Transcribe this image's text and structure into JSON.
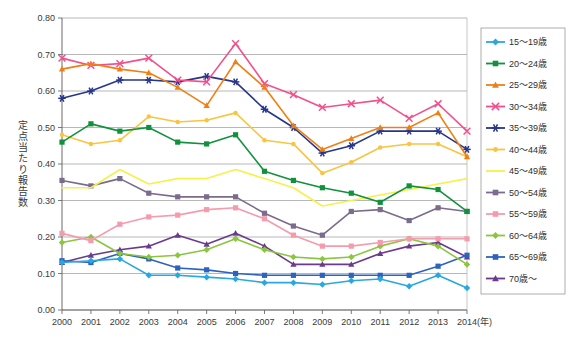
{
  "chart_data": {
    "type": "line",
    "title": "",
    "xlabel": "(年)",
    "ylabel": "定点当たり報告数",
    "x": [
      2000,
      2001,
      2002,
      2003,
      2004,
      2005,
      2006,
      2007,
      2008,
      2009,
      2010,
      2011,
      2012,
      2013,
      2014
    ],
    "xtick_labels": [
      "2000",
      "2001",
      "2002",
      "2003",
      "2004",
      "2005",
      "2006",
      "2007",
      "2008",
      "2009",
      "2010",
      "2011",
      "2012",
      "2013",
      "2014"
    ],
    "ytick_labels": [
      "0.00",
      "0.10",
      "0.20",
      "0.30",
      "0.40",
      "0.50",
      "0.60",
      "0.70",
      "0.80"
    ],
    "ylim": [
      0.0,
      0.8
    ],
    "ytick_step": 0.1,
    "grid": "horizontal",
    "legend_position": "right",
    "series": [
      {
        "name": "15～19歳",
        "color": "#29A8E0",
        "marker": "diamond",
        "values": [
          0.13,
          0.135,
          0.14,
          0.095,
          0.095,
          0.09,
          0.085,
          0.075,
          0.075,
          0.07,
          0.08,
          0.085,
          0.065,
          0.095,
          0.06
        ]
      },
      {
        "name": "20～24歳",
        "color": "#12913C",
        "marker": "square",
        "values": [
          0.46,
          0.51,
          0.49,
          0.5,
          0.46,
          0.455,
          0.48,
          0.38,
          0.355,
          0.335,
          0.32,
          0.295,
          0.34,
          0.33,
          0.27
        ]
      },
      {
        "name": "25～29歳",
        "color": "#F07F13",
        "marker": "triangle",
        "values": [
          0.66,
          0.675,
          0.66,
          0.65,
          0.61,
          0.56,
          0.68,
          0.61,
          0.505,
          0.44,
          0.47,
          0.5,
          0.5,
          0.54,
          0.42
        ]
      },
      {
        "name": "30～34歳",
        "color": "#F2508C",
        "marker": "cross",
        "values": [
          0.69,
          0.67,
          0.675,
          0.69,
          0.63,
          0.625,
          0.73,
          0.62,
          0.59,
          0.555,
          0.565,
          0.575,
          0.525,
          0.565,
          0.49
        ]
      },
      {
        "name": "35～39歳",
        "color": "#27368C",
        "marker": "star",
        "values": [
          0.58,
          0.6,
          0.63,
          0.63,
          0.625,
          0.64,
          0.625,
          0.55,
          0.5,
          0.43,
          0.45,
          0.49,
          0.49,
          0.49,
          0.44
        ]
      },
      {
        "name": "40～44歳",
        "color": "#F9C440",
        "marker": "circle",
        "values": [
          0.48,
          0.455,
          0.465,
          0.53,
          0.515,
          0.52,
          0.54,
          0.465,
          0.455,
          0.375,
          0.405,
          0.445,
          0.455,
          0.455,
          0.42
        ]
      },
      {
        "name": "45～49歳",
        "color": "#F6F14A",
        "marker": "none",
        "values": [
          0.335,
          0.335,
          0.385,
          0.345,
          0.36,
          0.36,
          0.385,
          0.36,
          0.335,
          0.285,
          0.3,
          0.315,
          0.33,
          0.345,
          0.36
        ]
      },
      {
        "name": "50～54歳",
        "color": "#7B6B8C",
        "marker": "square",
        "values": [
          0.355,
          0.34,
          0.36,
          0.32,
          0.31,
          0.31,
          0.31,
          0.265,
          0.23,
          0.205,
          0.27,
          0.275,
          0.245,
          0.28,
          0.27
        ]
      },
      {
        "name": "55～59歳",
        "color": "#F59BAE",
        "marker": "square",
        "values": [
          0.21,
          0.19,
          0.235,
          0.255,
          0.26,
          0.275,
          0.28,
          0.25,
          0.205,
          0.175,
          0.175,
          0.185,
          0.195,
          0.195,
          0.195
        ]
      },
      {
        "name": "60～64歳",
        "color": "#8CC63E",
        "marker": "diamond",
        "values": [
          0.185,
          0.2,
          0.155,
          0.145,
          0.15,
          0.165,
          0.195,
          0.165,
          0.145,
          0.14,
          0.145,
          0.175,
          0.195,
          0.175,
          0.125
        ]
      },
      {
        "name": "65～69歳",
        "color": "#2D63BE",
        "marker": "square",
        "values": [
          0.135,
          0.13,
          0.155,
          0.14,
          0.115,
          0.11,
          0.1,
          0.095,
          0.095,
          0.095,
          0.095,
          0.095,
          0.095,
          0.12,
          0.15
        ]
      },
      {
        "name": "70歳～",
        "color": "#6B3A8C",
        "marker": "triangle",
        "values": [
          0.13,
          0.15,
          0.165,
          0.175,
          0.205,
          0.18,
          0.21,
          0.175,
          0.125,
          0.125,
          0.125,
          0.155,
          0.175,
          0.185,
          0.145
        ]
      }
    ]
  },
  "legend": {
    "items": [
      {
        "label": "15～19歳"
      },
      {
        "label": "20～24歳"
      },
      {
        "label": "25～29歳"
      },
      {
        "label": "30～34歳"
      },
      {
        "label": "35～39歳"
      },
      {
        "label": "40～44歳"
      },
      {
        "label": "45～49歳"
      },
      {
        "label": "50～54歳"
      },
      {
        "label": "55～59歳"
      },
      {
        "label": "60～64歳"
      },
      {
        "label": "65～69歳"
      },
      {
        "label": "70歳～"
      }
    ]
  }
}
